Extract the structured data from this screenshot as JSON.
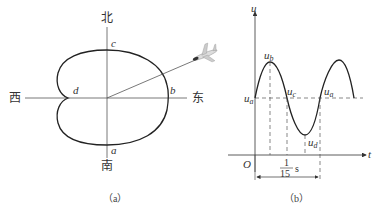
{
  "panel_a": {
    "caption": "（a）",
    "directions": {
      "north": "北",
      "south": "南",
      "west": "西",
      "east": "东"
    },
    "points": {
      "a": "a",
      "b": "b",
      "c": "c",
      "d": "d"
    },
    "icon": "airplane-icon"
  },
  "panel_b": {
    "caption": "（b）",
    "axis": {
      "y_label": "u",
      "x_label": "t",
      "origin": "O"
    },
    "labels": {
      "ua_left": "u",
      "ua_left_sub": "a",
      "ub": "u",
      "ub_sub": "b",
      "uc": "u",
      "uc_sub": "c",
      "ud": "u",
      "ud_sub": "d",
      "ua_right": "u",
      "ua_right_sub": "a"
    },
    "period": {
      "numerator": "1",
      "denominator": "15",
      "unit": "s"
    }
  }
}
